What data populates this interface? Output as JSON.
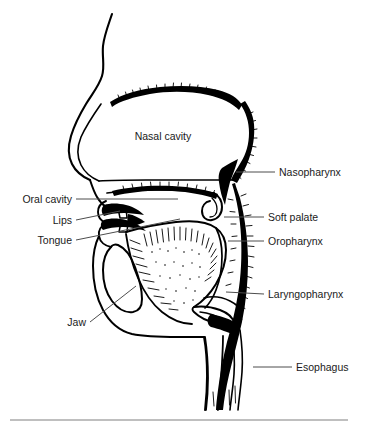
{
  "figure": {
    "type": "anatomical-line-diagram",
    "view": "mid-sagittal",
    "width": 367,
    "height": 432,
    "background_color": "#ffffff",
    "ink_color": "#000000",
    "leader_line_color": "#4d4d4d",
    "rule_color": "#808080",
    "label_font_size_px": 10.5
  },
  "labels": {
    "nasal_cavity": {
      "text": "Nasal cavity",
      "placement": "inside-interior",
      "anchor": "middle",
      "x": 163,
      "y": 140,
      "leader": false
    },
    "nasopharynx": {
      "text": "Nasopharynx",
      "placement": "right",
      "anchor": "start",
      "x": 279,
      "y": 176,
      "leader": true,
      "leader_from_x": 275,
      "leader_from_y": 172,
      "leader_to_x": 236,
      "leader_to_y": 172
    },
    "soft_palate": {
      "text": "Soft palate",
      "placement": "right",
      "anchor": "start",
      "x": 268,
      "y": 221,
      "leader": true,
      "leader_from_x": 264,
      "leader_from_y": 217,
      "leader_to_x": 224,
      "leader_to_y": 217
    },
    "oropharynx": {
      "text": "Oropharynx",
      "placement": "right",
      "anchor": "start",
      "x": 268,
      "y": 245,
      "leader": true,
      "leader_from_x": 264,
      "leader_from_y": 241,
      "leader_to_x": 228,
      "leader_to_y": 241
    },
    "laryngopharynx": {
      "text": "Laryngopharynx",
      "placement": "right",
      "anchor": "start",
      "x": 268,
      "y": 298,
      "leader": true,
      "leader_from_x": 264,
      "leader_from_y": 294,
      "leader_to_x": 226,
      "leader_to_y": 292
    },
    "esophagus": {
      "text": "Esophagus",
      "placement": "right",
      "anchor": "start",
      "x": 296,
      "y": 371,
      "leader": true,
      "leader_from_x": 292,
      "leader_from_y": 367,
      "leader_to_x": 253,
      "leader_to_y": 367
    },
    "oral_cavity": {
      "text": "Oral cavity",
      "placement": "left",
      "anchor": "end",
      "x": 72,
      "y": 203,
      "leader": true,
      "leader_from_x": 76,
      "leader_from_y": 199,
      "leader_to_x": 178,
      "leader_to_y": 199
    },
    "lips": {
      "text": "Lips",
      "placement": "left",
      "anchor": "end",
      "x": 72,
      "y": 224,
      "leader": true,
      "leader_from_x": 76,
      "leader_from_y": 220,
      "leader_to_x": 120,
      "leader_to_y": 211
    },
    "tongue": {
      "text": "Tongue",
      "placement": "left",
      "anchor": "end",
      "x": 72,
      "y": 244,
      "leader": true,
      "leader_from_x": 76,
      "leader_from_y": 240,
      "leader_to_x": 180,
      "leader_to_y": 219
    },
    "jaw": {
      "text": "Jaw",
      "placement": "left-lower",
      "anchor": "end",
      "x": 86,
      "y": 326,
      "leader": true,
      "leader_from_x": 90,
      "leader_from_y": 322,
      "leader_to_x": 136,
      "leader_to_y": 286
    }
  },
  "label_order": [
    "nasal_cavity",
    "nasopharynx",
    "oral_cavity",
    "soft_palate",
    "lips",
    "oropharynx",
    "tongue",
    "laryngopharynx",
    "jaw",
    "esophagus"
  ],
  "structures": [
    "facial profile",
    "nasal cavity",
    "hard palate",
    "soft palate and uvula",
    "nasopharynx",
    "oropharynx",
    "laryngopharynx",
    "tongue",
    "lips",
    "teeth",
    "mandible (jaw)",
    "epiglottis",
    "larynx",
    "trachea",
    "esophagus"
  ]
}
